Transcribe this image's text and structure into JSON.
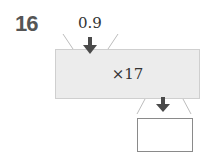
{
  "problem": {
    "number": "16",
    "input_value": "0.9",
    "operation": "×17",
    "output_value": ""
  },
  "colors": {
    "number": "#555555",
    "machine_fill": "#ececec",
    "arrow": "#4a4a4a"
  }
}
